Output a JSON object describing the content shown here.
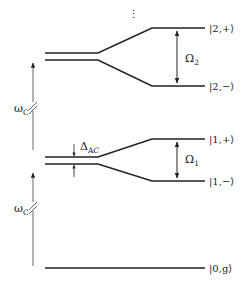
{
  "diagram": {
    "colors": {
      "line": "#222222",
      "arrow": "#555555",
      "background": "#ffffff"
    },
    "ellipsis": "⋮",
    "states": [
      {
        "id": "2plus",
        "label": "|2,+⟩"
      },
      {
        "id": "2minus",
        "label": "|2,−⟩"
      },
      {
        "id": "1plus",
        "label": "|1,+⟩"
      },
      {
        "id": "1minus",
        "label": "|1,−⟩"
      },
      {
        "id": "0g",
        "label": "|0,g⟩"
      }
    ],
    "splittings": {
      "omega2": {
        "main": "Ω",
        "sub": "2"
      },
      "omega1": {
        "main": "Ω",
        "sub": "1"
      }
    },
    "ac_shift": {
      "main": "Δ",
      "sub": "AC"
    },
    "cavity_frequency": [
      {
        "main": "ω",
        "sub": "C"
      },
      {
        "main": "ω",
        "sub": "C"
      }
    ]
  }
}
